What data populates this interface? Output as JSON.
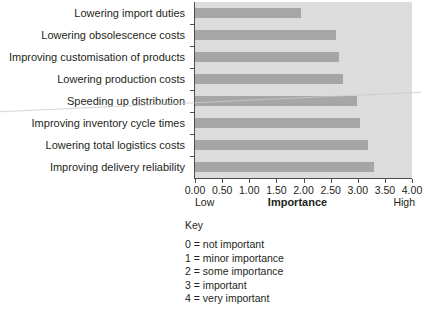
{
  "chart_data": {
    "type": "bar",
    "orientation": "horizontal",
    "title": "",
    "xlabel": "Importance",
    "ylabel": "",
    "xlim": [
      0,
      4
    ],
    "grid": false,
    "legend_position": "below",
    "categories": [
      "Lowering import duties",
      "Lowering obsolescence costs",
      "Improving customisation of products",
      "Lowering production costs",
      "Speeding up distribution",
      "Improving inventory cycle times",
      "Lowering total logistics costs",
      "Improving delivery reliability"
    ],
    "values": [
      1.95,
      2.6,
      2.65,
      2.72,
      2.98,
      3.05,
      3.18,
      3.3
    ],
    "x_tick_labels": [
      "0.00",
      "0.50",
      "1.00",
      "1.50",
      "2.00",
      "2.50",
      "3.00",
      "3.50",
      "4.00"
    ],
    "x_tick_values": [
      0,
      0.5,
      1,
      1.5,
      2,
      2.5,
      3,
      3.5,
      4
    ],
    "axis_end_labels": {
      "low": "Low",
      "high": "High"
    },
    "colors": {
      "bar": "#a6a6a6",
      "plot_background": "#dcdcdc",
      "axis": "#4d4d4d",
      "text": "#231f20",
      "page_background": "#ffffff"
    }
  },
  "key": {
    "title": "Key",
    "items": [
      "0 = not important",
      "1 = minor importance",
      "2 = some importance",
      "3 = important",
      "4 = very important"
    ]
  }
}
